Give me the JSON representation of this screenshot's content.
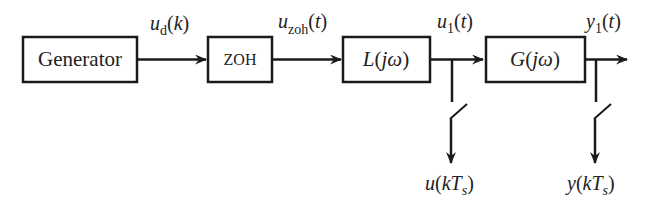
{
  "diagram": {
    "type": "block-diagram",
    "blocks": [
      {
        "id": "generator",
        "label": "Generator"
      },
      {
        "id": "zoh",
        "label": "ZOH"
      },
      {
        "id": "L",
        "label": "L(jω)",
        "name": "L",
        "arg": "jω"
      },
      {
        "id": "G",
        "label": "G(jω)",
        "name": "G",
        "arg": "jω"
      }
    ],
    "signals": {
      "ud": {
        "base": "u",
        "sub": "d",
        "arg": "k",
        "text": "u_d(k)"
      },
      "uzoh": {
        "base": "u",
        "sub": "zoh",
        "arg": "t",
        "text": "u_zoh(t)"
      },
      "u1": {
        "base": "u",
        "sub": "1",
        "arg": "t",
        "text": "u_1(t)"
      },
      "y1": {
        "base": "y",
        "sub": "1",
        "arg": "t",
        "text": "y_1(t)"
      },
      "u_sampled": {
        "base": "u",
        "arg_k": "k",
        "arg_T": "T",
        "arg_sub": "s",
        "text": "u(kT_s)"
      },
      "y_sampled": {
        "base": "y",
        "arg_k": "k",
        "arg_T": "T",
        "arg_sub": "s",
        "text": "y(kT_s)"
      }
    },
    "edges": [
      {
        "from": "generator",
        "to": "zoh",
        "signal": "u_d(k)"
      },
      {
        "from": "zoh",
        "to": "L",
        "signal": "u_zoh(t)"
      },
      {
        "from": "L",
        "to": "G",
        "signal": "u_1(t)"
      },
      {
        "from": "G",
        "to": "output",
        "signal": "y_1(t)"
      },
      {
        "from": "u_1 branch",
        "to": "sampler switch",
        "signal": "u(kT_s)"
      },
      {
        "from": "y_1 branch",
        "to": "sampler switch",
        "signal": "y(kT_s)"
      }
    ]
  }
}
